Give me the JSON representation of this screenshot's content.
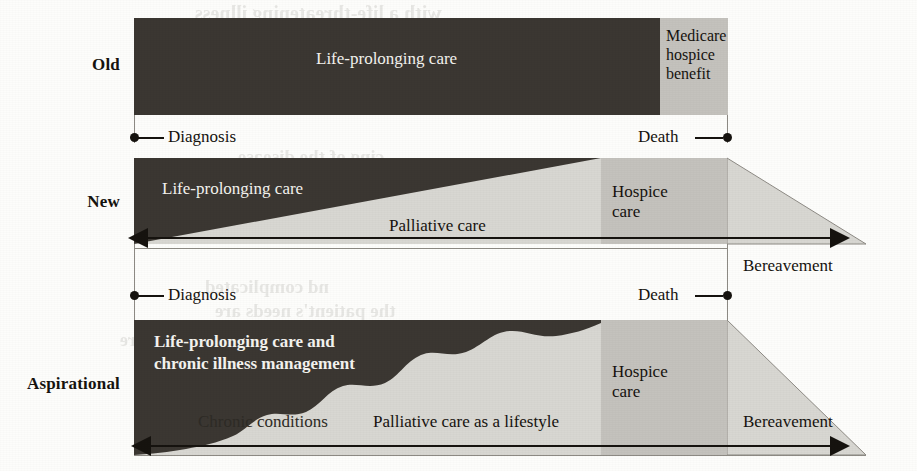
{
  "figure": {
    "rows": [
      {
        "key": "old",
        "label": "Old",
        "segments": [
          {
            "name": "life-prolonging-care",
            "label": "Life-prolonging care",
            "fill": "#3b3732"
          },
          {
            "name": "medicare-hospice-benefit",
            "label": "Medicare\nhospice\nbenefit",
            "fill": "#c4c2bd"
          }
        ],
        "markers": {
          "start": "Diagnosis",
          "end": "Death"
        }
      },
      {
        "key": "new",
        "label": "New",
        "segments": [
          {
            "name": "life-prolonging-care",
            "label": "Life-prolonging care",
            "fill": "#3b3732"
          },
          {
            "name": "palliative-care",
            "label": "Palliative care",
            "fill": "#d8d7d2"
          },
          {
            "name": "hospice-care",
            "label": "Hospice\ncare",
            "fill": "#c4c2bd"
          },
          {
            "name": "bereavement",
            "label": "Bereavement",
            "fill": "#d8d7d2"
          }
        ],
        "markers": {
          "start": "Diagnosis",
          "end": "Death"
        }
      },
      {
        "key": "aspirational",
        "label": "Aspirational",
        "segments": [
          {
            "name": "life-prolonging-care-chronic",
            "label": "Life-prolonging care and\nchronic illness management",
            "fill": "#3b3732"
          },
          {
            "name": "chronic-conditions",
            "label": "Chronic conditions",
            "fill": "#d8d7d2"
          },
          {
            "name": "palliative-care-lifestyle",
            "label": "Palliative care as a lifestyle",
            "fill": "#d8d7d2"
          },
          {
            "name": "hospice-care",
            "label": "Hospice\ncare",
            "fill": "#c4c2bd"
          },
          {
            "name": "bereavement",
            "label": "Bereavement",
            "fill": "#d8d7d2"
          }
        ],
        "markers": {
          "start": "Diagnosis",
          "end": "Death"
        }
      }
    ],
    "labels": {
      "old": "Old",
      "new": "New",
      "aspirational": "Aspirational",
      "life_prolonging_care": "Life-prolonging care",
      "medicare_hospice_benefit": "Medicare\nhospice\nbenefit",
      "palliative_care": "Palliative care",
      "hospice_care": "Hospice\ncare",
      "bereavement": "Bereavement",
      "life_prolonging_chronic": "Life-prolonging care and\nchronic illness management",
      "chronic_conditions": "Chronic conditions",
      "palliative_lifestyle": "Palliative care as a lifestyle",
      "diagnosis": "Diagnosis",
      "death": "Death"
    },
    "colors": {
      "dark": "#3b3732",
      "mid_gray": "#c4c2bd",
      "light_gray": "#d8d7d2",
      "ink": "#16130f",
      "paper": "#fdfdfb",
      "hairline": "#8d8a84"
    }
  },
  "bleed_through": {
    "lines": [
      {
        "text": "with a life-threatening illness",
        "x": 195,
        "y": 2,
        "size": 20
      },
      {
        "text": "cing of the disease",
        "x": 238,
        "y": 146,
        "size": 19
      },
      {
        "text": "nd complicated",
        "x": 205,
        "y": 276,
        "size": 19
      },
      {
        "text": "the patient's needs are",
        "x": 215,
        "y": 300,
        "size": 19
      },
      {
        "text": "e care",
        "x": 120,
        "y": 330,
        "size": 18
      }
    ]
  }
}
